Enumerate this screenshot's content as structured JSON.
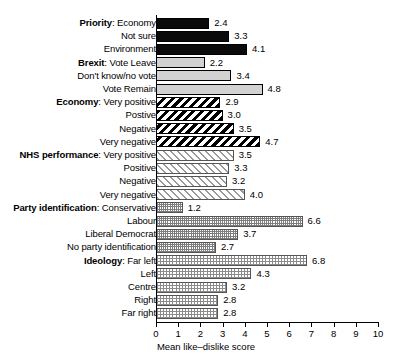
{
  "chart_data": {
    "type": "bar",
    "orientation": "horizontal",
    "title": "",
    "xlabel": "Mean like–dislike score",
    "ylabel": "",
    "xlim": [
      0,
      10
    ],
    "xticks": [
      "0",
      "1",
      "2",
      "3",
      "4",
      "5",
      "6",
      "7",
      "8",
      "9",
      "10"
    ],
    "grid": false,
    "legend": "none",
    "categories": [
      "Priority: Economy",
      "Not sure",
      "Environment",
      "Brexit: Vote Leave",
      "Don't know/no vote",
      "Vote Remain",
      "Economy: Very positive",
      "Postive",
      "Negative",
      "Very negative",
      "NHS performance: Very positive",
      "Positive",
      "Negative",
      "Very negative",
      "Party identification: Conservative",
      "Labour",
      "Liberal Democrat",
      "No party identification",
      "Ideology: Far left",
      "Left",
      "Centre",
      "Right",
      "Far right"
    ],
    "values": [
      2.4,
      3.3,
      4.1,
      2.2,
      3.4,
      4.8,
      2.9,
      3.0,
      3.5,
      4.7,
      3.5,
      3.3,
      3.2,
      4.0,
      1.2,
      6.6,
      3.7,
      2.7,
      6.8,
      4.3,
      3.2,
      2.8,
      2.8
    ],
    "groups": [
      {
        "name": "Priority",
        "fill": "solid-black"
      },
      {
        "name": "Brexit",
        "fill": "solid-gray"
      },
      {
        "name": "Economy",
        "fill": "hatch-black"
      },
      {
        "name": "NHS performance",
        "fill": "hatch-gray"
      },
      {
        "name": "Party identification",
        "fill": "dot-dense"
      },
      {
        "name": "Ideology",
        "fill": "dot-sparse"
      }
    ]
  },
  "bars": [
    {
      "group": "Priority",
      "label": "Economy",
      "value": 2.4,
      "value_text": "2.4",
      "fill": "solid-black"
    },
    {
      "group": "",
      "label": "Not sure",
      "value": 3.3,
      "value_text": "3.3",
      "fill": "solid-black"
    },
    {
      "group": "",
      "label": "Environment",
      "value": 4.1,
      "value_text": "4.1",
      "fill": "solid-black"
    },
    {
      "group": "Brexit",
      "label": "Vote Leave",
      "value": 2.2,
      "value_text": "2.2",
      "fill": "solid-gray"
    },
    {
      "group": "",
      "label": "Don't know/no vote",
      "value": 3.4,
      "value_text": "3.4",
      "fill": "solid-gray"
    },
    {
      "group": "",
      "label": "Vote Remain",
      "value": 4.8,
      "value_text": "4.8",
      "fill": "solid-gray"
    },
    {
      "group": "Economy",
      "label": "Very positive",
      "value": 2.9,
      "value_text": "2.9",
      "fill": "hatch-black"
    },
    {
      "group": "",
      "label": "Postive",
      "value": 3.0,
      "value_text": "3.0",
      "fill": "hatch-black"
    },
    {
      "group": "",
      "label": "Negative",
      "value": 3.5,
      "value_text": "3.5",
      "fill": "hatch-black"
    },
    {
      "group": "",
      "label": "Very negative",
      "value": 4.7,
      "value_text": "4.7",
      "fill": "hatch-black"
    },
    {
      "group": "NHS performance",
      "label": "Very positive",
      "value": 3.5,
      "value_text": "3.5",
      "fill": "hatch-gray"
    },
    {
      "group": "",
      "label": "Positive",
      "value": 3.3,
      "value_text": "3.3",
      "fill": "hatch-gray"
    },
    {
      "group": "",
      "label": "Negative",
      "value": 3.2,
      "value_text": "3.2",
      "fill": "hatch-gray"
    },
    {
      "group": "",
      "label": "Very negative",
      "value": 4.0,
      "value_text": "4.0",
      "fill": "hatch-gray"
    },
    {
      "group": "Party identification",
      "label": "Conservative",
      "value": 1.2,
      "value_text": "1.2",
      "fill": "dot-dense"
    },
    {
      "group": "",
      "label": "Labour",
      "value": 6.6,
      "value_text": "6.6",
      "fill": "dot-dense"
    },
    {
      "group": "",
      "label": "Liberal Democrat",
      "value": 3.7,
      "value_text": "3.7",
      "fill": "dot-dense"
    },
    {
      "group": "",
      "label": "No party identification",
      "value": 2.7,
      "value_text": "2.7",
      "fill": "dot-dense"
    },
    {
      "group": "Ideology",
      "label": "Far left",
      "value": 6.8,
      "value_text": "6.8",
      "fill": "dot-sparse"
    },
    {
      "group": "",
      "label": "Left",
      "value": 4.3,
      "value_text": "4.3",
      "fill": "dot-sparse"
    },
    {
      "group": "",
      "label": "Centre",
      "value": 3.2,
      "value_text": "3.2",
      "fill": "dot-sparse"
    },
    {
      "group": "",
      "label": "Right",
      "value": 2.8,
      "value_text": "2.8",
      "fill": "dot-sparse"
    },
    {
      "group": "",
      "label": "Far right",
      "value": 2.8,
      "value_text": "2.8",
      "fill": "dot-sparse"
    }
  ],
  "axis": {
    "x_title": "Mean like–dislike score",
    "ticks": [
      "0",
      "1",
      "2",
      "3",
      "4",
      "5",
      "6",
      "7",
      "8",
      "9",
      "10"
    ]
  },
  "colors": {
    "ink": "#000000",
    "solid_black": "#0a0a0a",
    "solid_gray": "#d2d2d2",
    "hatch_gray": "#9a9a9a",
    "dot_gray": "#7d7d7d",
    "background": "#ffffff"
  }
}
